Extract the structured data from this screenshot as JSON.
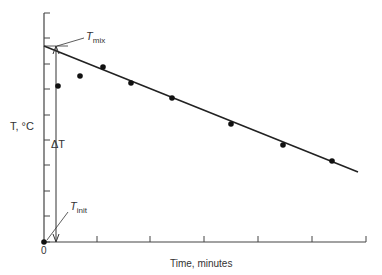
{
  "chart_data": {
    "type": "scatter",
    "title": "",
    "xlabel": "Time, minutes",
    "ylabel": "T, °C",
    "x_origin_label": "0",
    "x_ticks_px": [
      44,
      97,
      150,
      204,
      258,
      312,
      366
    ],
    "y_ticks_px": [
      13,
      38,
      64,
      89,
      115,
      140,
      165,
      191,
      216,
      242
    ],
    "grid": false,
    "legend": null,
    "series": [
      {
        "name": "measured temperature",
        "points_px": [
          [
            44,
            242
          ],
          [
            58,
            86
          ],
          [
            80,
            76
          ],
          [
            103,
            67
          ],
          [
            131,
            83
          ],
          [
            172,
            98
          ],
          [
            231,
            124
          ],
          [
            283,
            145
          ],
          [
            332,
            161
          ]
        ]
      }
    ],
    "fit_line": {
      "name": "extrapolated cooling line",
      "from_px": [
        44,
        46
      ],
      "to_px": [
        358,
        172
      ]
    },
    "annotations": {
      "t_mix": {
        "main": "T",
        "sub": "mix"
      },
      "t_init": {
        "main": "T",
        "sub": "init"
      },
      "delta_t": "ΔT"
    }
  },
  "labels": {
    "ylabel": "T, °C",
    "xlabel": "Time, minutes",
    "origin": "0",
    "delta_t": "ΔT",
    "t_mix_main": "T",
    "t_mix_sub": "mix",
    "t_init_main": "T",
    "t_init_sub": "init"
  }
}
